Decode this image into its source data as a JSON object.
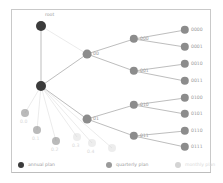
{
  "chart_data": {
    "type": "diagram",
    "title": "",
    "subtitle": "",
    "xlabel": "",
    "ylabel": "",
    "grid": false,
    "legend_position": "bottom",
    "palette": {
      "annual": "#3b3b3b",
      "quarterly": "#8c8c8c",
      "monthly": "#d6d6d6",
      "edge": "#b5b5b5",
      "edge_faded": "#e2e2e2",
      "label": "#9a9a9a",
      "label_faded": "#d8d8d8",
      "frame": "#c9c9c9",
      "background": "#ffffff"
    },
    "nodes": [
      {
        "id": "root",
        "label": "root",
        "x": 41,
        "y": 26,
        "r": 5.0,
        "tier": "annual",
        "faded": false,
        "label_dx": 4,
        "label_dy": -11
      },
      {
        "id": "0",
        "label": "",
        "x": 41,
        "y": 86,
        "r": 5.0,
        "tier": "annual",
        "faded": false,
        "label_dx": 7,
        "label_dy": 0
      },
      {
        "id": "00",
        "label": "00",
        "x": 87,
        "y": 54,
        "r": 4.4,
        "tier": "quarterly",
        "faded": false,
        "label_dx": 6,
        "label_dy": 0
      },
      {
        "id": "01",
        "label": "01",
        "x": 87,
        "y": 119,
        "r": 4.4,
        "tier": "quarterly",
        "faded": false,
        "label_dx": 6,
        "label_dy": 0
      },
      {
        "id": "000",
        "label": "000",
        "x": 134,
        "y": 39,
        "r": 4.2,
        "tier": "quarterly",
        "faded": false,
        "label_dx": 6,
        "label_dy": 0
      },
      {
        "id": "001",
        "label": "001",
        "x": 134,
        "y": 71,
        "r": 4.2,
        "tier": "quarterly",
        "faded": false,
        "label_dx": 6,
        "label_dy": 0
      },
      {
        "id": "010",
        "label": "010",
        "x": 134,
        "y": 105,
        "r": 4.2,
        "tier": "quarterly",
        "faded": false,
        "label_dx": 6,
        "label_dy": 0
      },
      {
        "id": "011",
        "label": "011",
        "x": 134,
        "y": 136,
        "r": 4.2,
        "tier": "quarterly",
        "faded": false,
        "label_dx": 6,
        "label_dy": 0
      },
      {
        "id": "0000",
        "label": "0000",
        "x": 185,
        "y": 30,
        "r": 4.2,
        "tier": "quarterly",
        "faded": false,
        "label_dx": 6,
        "label_dy": 0
      },
      {
        "id": "0001",
        "label": "0001",
        "x": 185,
        "y": 47,
        "r": 4.2,
        "tier": "quarterly",
        "faded": false,
        "label_dx": 6,
        "label_dy": 0
      },
      {
        "id": "0010",
        "label": "0010",
        "x": 185,
        "y": 64,
        "r": 4.2,
        "tier": "quarterly",
        "faded": false,
        "label_dx": 6,
        "label_dy": 0
      },
      {
        "id": "0011",
        "label": "0011",
        "x": 185,
        "y": 81,
        "r": 4.2,
        "tier": "quarterly",
        "faded": false,
        "label_dx": 6,
        "label_dy": 0
      },
      {
        "id": "0100",
        "label": "0100",
        "x": 185,
        "y": 98,
        "r": 4.2,
        "tier": "quarterly",
        "faded": false,
        "label_dx": 6,
        "label_dy": 0
      },
      {
        "id": "0101",
        "label": "0101",
        "x": 185,
        "y": 114,
        "r": 4.2,
        "tier": "quarterly",
        "faded": false,
        "label_dx": 6,
        "label_dy": 0
      },
      {
        "id": "0110",
        "label": "0110",
        "x": 185,
        "y": 131,
        "r": 4.2,
        "tier": "quarterly",
        "faded": false,
        "label_dx": 6,
        "label_dy": 0
      },
      {
        "id": "0111",
        "label": "0111",
        "x": 185,
        "y": 147,
        "r": 4.2,
        "tier": "quarterly",
        "faded": false,
        "label_dx": 6,
        "label_dy": 0
      },
      {
        "id": "0.0",
        "label": "0.0",
        "x": 25,
        "y": 113,
        "r": 4.0,
        "tier": "quarterly",
        "faded": true,
        "label_dx": -5,
        "label_dy": 9
      },
      {
        "id": "0.1",
        "label": "0.1",
        "x": 37,
        "y": 130,
        "r": 4.0,
        "tier": "quarterly",
        "faded": true,
        "label_dx": -5,
        "label_dy": 9
      },
      {
        "id": "0.2",
        "label": "0.2",
        "x": 56,
        "y": 141,
        "r": 4.0,
        "tier": "quarterly",
        "faded": true,
        "label_dx": -5,
        "label_dy": 9
      },
      {
        "id": "0.3",
        "label": "0.3",
        "x": 77,
        "y": 137,
        "r": 4.0,
        "tier": "monthly",
        "faded": true,
        "label_dx": -5,
        "label_dy": 9
      },
      {
        "id": "0.4",
        "label": "0.4",
        "x": 92,
        "y": 143,
        "r": 4.0,
        "tier": "monthly",
        "faded": true,
        "label_dx": -5,
        "label_dy": 9
      },
      {
        "id": "0.5",
        "label": "",
        "x": 112,
        "y": 148,
        "r": 4.0,
        "tier": "monthly",
        "faded": true,
        "label_dx": -5,
        "label_dy": 9
      }
    ],
    "edges": [
      {
        "from": "root",
        "to": "0",
        "faded": false
      },
      {
        "from": "0",
        "to": "00",
        "faded": false
      },
      {
        "from": "0",
        "to": "01",
        "faded": false
      },
      {
        "from": "00",
        "to": "000",
        "faded": false
      },
      {
        "from": "00",
        "to": "001",
        "faded": false
      },
      {
        "from": "01",
        "to": "010",
        "faded": false
      },
      {
        "from": "01",
        "to": "011",
        "faded": false
      },
      {
        "from": "000",
        "to": "0000",
        "faded": false
      },
      {
        "from": "000",
        "to": "0001",
        "faded": false
      },
      {
        "from": "001",
        "to": "0010",
        "faded": false
      },
      {
        "from": "001",
        "to": "0011",
        "faded": false
      },
      {
        "from": "010",
        "to": "0100",
        "faded": false
      },
      {
        "from": "010",
        "to": "0101",
        "faded": false
      },
      {
        "from": "011",
        "to": "0110",
        "faded": false
      },
      {
        "from": "011",
        "to": "0111",
        "faded": false
      },
      {
        "from": "0",
        "to": "0.0",
        "faded": true
      },
      {
        "from": "0",
        "to": "0.1",
        "faded": true
      },
      {
        "from": "0",
        "to": "0.2",
        "faded": true
      },
      {
        "from": "0",
        "to": "0.3",
        "faded": true
      },
      {
        "from": "0",
        "to": "0.4",
        "faded": true
      },
      {
        "from": "0",
        "to": "0.5",
        "faded": true
      },
      {
        "from": "root",
        "to": "00",
        "faded": true
      }
    ],
    "legend": [
      {
        "label": "annual plan",
        "color": "#3b3b3b",
        "x": 0
      },
      {
        "label": "quarterly plan",
        "color": "#9a9a9a",
        "x": 88
      },
      {
        "label": "monthly plan",
        "color": "#d4d4d4",
        "x": 157
      }
    ]
  }
}
